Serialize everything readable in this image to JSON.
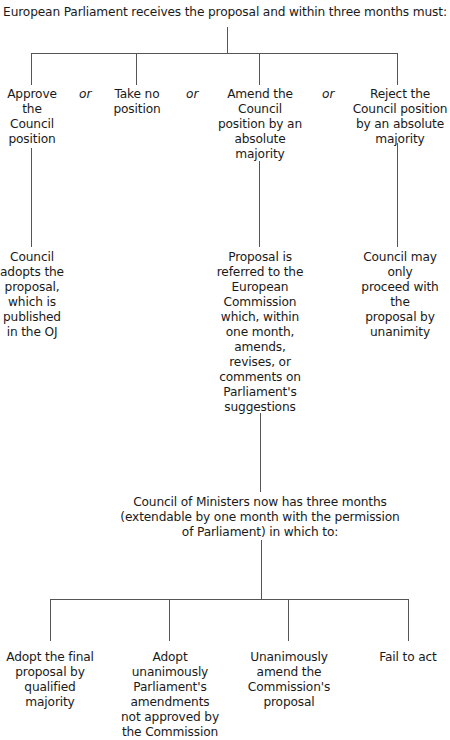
{
  "diagram": {
    "root": "European Parliament receives the proposal and within three months must:",
    "connector_word": "or",
    "options": [
      {
        "lines": [
          "Approve",
          "the",
          "Council",
          "position"
        ]
      },
      {
        "lines": [
          "Take no",
          "position"
        ]
      },
      {
        "lines": [
          "Amend the",
          "Council",
          "position by an",
          "absolute",
          "majority"
        ]
      },
      {
        "lines": [
          "Reject the",
          "Council position",
          "by an absolute",
          "majority"
        ]
      }
    ],
    "outcomes": {
      "approve": [
        "Council",
        "adopts the",
        "proposal,",
        "which is",
        "published",
        "in the OJ"
      ],
      "amend": [
        "Proposal is",
        "referred to the",
        "European",
        "Commission",
        "which, within",
        "one month,",
        "amends,",
        "revises, or",
        "comments on",
        "Parliament's",
        "suggestions"
      ],
      "reject": [
        "Council may only",
        "proceed with the",
        "proposal by",
        "unanimity"
      ]
    },
    "council_stage": [
      "Council of Ministers now has three months",
      "(extendable by one month with the permission",
      "of Parliament) in which to:"
    ],
    "final_options": [
      {
        "lines": [
          "Adopt the final",
          "proposal by",
          "qualified",
          "majority"
        ]
      },
      {
        "lines": [
          "Adopt",
          "unanimously",
          "Parliament's",
          "amendments",
          "not approved by",
          "the Commission"
        ]
      },
      {
        "lines": [
          "Unanimously",
          "amend the",
          "Commission's",
          "proposal"
        ]
      },
      {
        "lines": [
          "Fail to act"
        ]
      }
    ]
  }
}
